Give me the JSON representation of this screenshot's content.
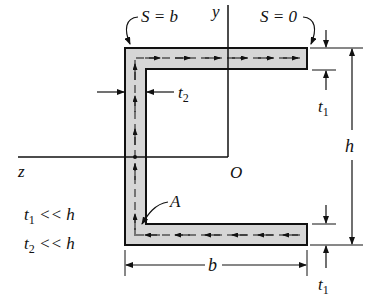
{
  "diagram": {
    "type": "channel-section-shear-flow",
    "colors": {
      "fill": "#d6d6d6",
      "stroke": "#111111",
      "background": "#ffffff"
    },
    "labels": {
      "s_start": "S = 0",
      "s_end": "S = b",
      "y_axis": "y",
      "z_axis": "z",
      "origin": "O",
      "point_a": "A",
      "height": "h",
      "width": "b",
      "t1_top": "t",
      "t1_top_sub": "1",
      "t1_bottom": "t",
      "t1_bottom_sub": "1",
      "t2": "t",
      "t2_sub": "2",
      "cond1": "t",
      "cond1_sub": "1",
      "cond1_rest": " << h",
      "cond2": "t",
      "cond2_sub": "2",
      "cond2_rest": " << h"
    }
  }
}
